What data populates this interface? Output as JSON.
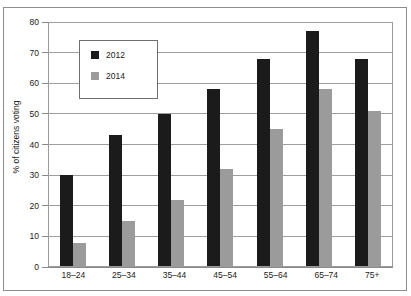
{
  "chart_data": {
    "type": "bar",
    "title": "",
    "subtitle": "",
    "xlabel": "",
    "ylabel": "% of citizens voting",
    "categories": [
      "18–24",
      "25–34",
      "35–44",
      "45–54",
      "55–64",
      "65–74",
      "75+"
    ],
    "series": [
      {
        "name": "2012",
        "color": "#1b1b1b",
        "values": [
          30,
          43,
          50,
          58,
          68,
          77,
          68
        ]
      },
      {
        "name": "2014",
        "color": "#9b9b9b",
        "values": [
          8,
          15,
          22,
          32,
          45,
          58,
          51
        ]
      }
    ],
    "ylim": [
      0,
      80
    ],
    "ytick_labels": [
      "80",
      "70",
      "60",
      "50",
      "40",
      "30",
      "20",
      "10",
      "0"
    ],
    "ytick_values": [
      80,
      70,
      60,
      50,
      40,
      30,
      20,
      10,
      0
    ],
    "grid": true,
    "legend_position": "upper-left-inside"
  },
  "legend": {
    "entries": [
      {
        "label": "2012",
        "swatch": "black-square-icon"
      },
      {
        "label": "2014",
        "swatch": "gray-square-icon"
      }
    ]
  }
}
